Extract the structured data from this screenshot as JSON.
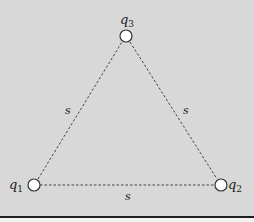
{
  "diagram": {
    "title": "",
    "background_color": "#d8d8d8",
    "line_color": "#444444",
    "charges": [
      {
        "id": "q1",
        "label": "q",
        "subscript": "1",
        "x": 34,
        "y": 185
      },
      {
        "id": "q2",
        "label": "q",
        "subscript": "2",
        "x": 221,
        "y": 185
      },
      {
        "id": "q3",
        "label": "q",
        "subscript": "3",
        "x": 126,
        "y": 36
      }
    ],
    "sides": [
      {
        "from": "q1",
        "to": "q3",
        "label": "s"
      },
      {
        "from": "q3",
        "to": "q2",
        "label": "s"
      },
      {
        "from": "q1",
        "to": "q2",
        "label": "s"
      }
    ]
  }
}
